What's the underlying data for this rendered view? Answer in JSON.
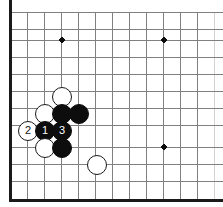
{
  "diagram": {
    "board": {
      "background_color": "#ffffff",
      "grid_color": "#808080",
      "edge_color": "#1a1a1a",
      "grid_spacing": 17,
      "origin_x": 10,
      "origin_y": 12,
      "edge_left_x": 10,
      "edge_bottom_y": 200,
      "columns": 13,
      "rows": 12,
      "vertical_lines_x": [
        10,
        27,
        44,
        61,
        78,
        95,
        112,
        129,
        146,
        163,
        180,
        197,
        214
      ],
      "horizontal_lines_y": [
        12,
        29,
        40,
        57,
        74,
        91,
        108,
        125,
        142,
        147,
        164,
        181,
        199
      ]
    },
    "star_points": [
      {
        "name": "star-point-top-left",
        "x": 62,
        "y": 40
      },
      {
        "name": "star-point-top-right",
        "x": 164,
        "y": 40
      },
      {
        "name": "star-point-bottom-right",
        "x": 164,
        "y": 147
      }
    ],
    "stones": [
      {
        "name": "white-stone-a",
        "color": "white",
        "x": 62,
        "y": 97,
        "r": 10,
        "label": ""
      },
      {
        "name": "white-stone-b",
        "color": "white",
        "x": 45,
        "y": 114,
        "r": 10,
        "label": ""
      },
      {
        "name": "black-stone-a",
        "color": "black",
        "x": 62,
        "y": 114,
        "r": 10,
        "label": ""
      },
      {
        "name": "black-stone-b",
        "color": "black",
        "x": 79,
        "y": 114,
        "r": 10,
        "label": ""
      },
      {
        "name": "white-stone-move-2",
        "color": "white",
        "x": 28,
        "y": 131,
        "r": 10,
        "label": "2"
      },
      {
        "name": "black-stone-move-1",
        "color": "black",
        "x": 45,
        "y": 131,
        "r": 10,
        "label": "1"
      },
      {
        "name": "black-stone-move-3",
        "color": "black",
        "x": 62,
        "y": 131,
        "r": 10,
        "label": "3"
      },
      {
        "name": "white-stone-c",
        "color": "white",
        "x": 45,
        "y": 148,
        "r": 10,
        "label": ""
      },
      {
        "name": "black-stone-c",
        "color": "black",
        "x": 62,
        "y": 148,
        "r": 10,
        "label": ""
      },
      {
        "name": "white-stone-d",
        "color": "white",
        "x": 97,
        "y": 165,
        "r": 10,
        "label": ""
      }
    ],
    "move_sequence": [
      {
        "number": "1",
        "color": "black"
      },
      {
        "number": "2",
        "color": "white"
      },
      {
        "number": "3",
        "color": "black"
      }
    ]
  }
}
